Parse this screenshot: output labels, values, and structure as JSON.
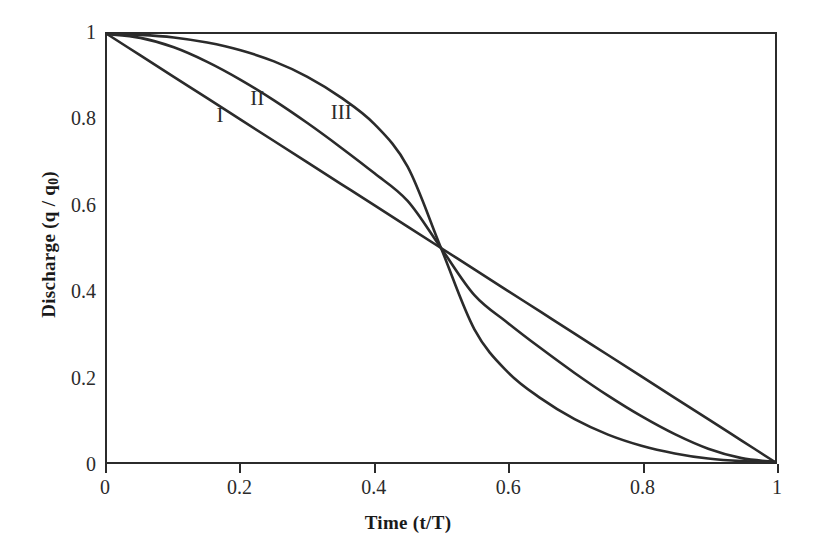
{
  "chart_data": {
    "type": "line",
    "title": "",
    "xlabel": "Time (t/T)",
    "ylabel_main": "Discharge (q / q",
    "ylabel_sub": "0",
    "ylabel_close": ")",
    "xlim": [
      0,
      1
    ],
    "ylim": [
      0,
      1
    ],
    "grid": false,
    "legend": "inline-curve-labels",
    "xticks": [
      "0",
      "0.2",
      "0.4",
      "0.6",
      "0.8",
      "1"
    ],
    "xtick_values": [
      0,
      0.2,
      0.4,
      0.6,
      0.8,
      1
    ],
    "yticks": [
      "0",
      "0.2",
      "0.4",
      "0.6",
      "0.8",
      "1"
    ],
    "ytick_values": [
      0,
      0.2,
      0.4,
      0.6,
      0.8,
      1
    ],
    "x": [
      0,
      0.05,
      0.1,
      0.15,
      0.2,
      0.25,
      0.3,
      0.35,
      0.4,
      0.45,
      0.5,
      0.55,
      0.6,
      0.65,
      0.7,
      0.75,
      0.8,
      0.85,
      0.9,
      0.95,
      1
    ],
    "series": [
      {
        "name": "I",
        "label": "I",
        "color": "#2b2b2b",
        "values": [
          1,
          0.95,
          0.9,
          0.85,
          0.8,
          0.75,
          0.7,
          0.65,
          0.6,
          0.55,
          0.5,
          0.45,
          0.4,
          0.35,
          0.3,
          0.25,
          0.2,
          0.15,
          0.1,
          0.05,
          0
        ],
        "label_x": 0.175,
        "label_y": 0.805
      },
      {
        "name": "II",
        "label": "II",
        "color": "#2b2b2b",
        "values": [
          1,
          0.991,
          0.969,
          0.935,
          0.893,
          0.845,
          0.792,
          0.735,
          0.675,
          0.61,
          0.5,
          0.39,
          0.325,
          0.265,
          0.208,
          0.155,
          0.107,
          0.065,
          0.031,
          0.009,
          0
        ],
        "label_x": 0.225,
        "label_y": 0.845
      },
      {
        "name": "III",
        "label": "III",
        "color": "#2b2b2b",
        "values": [
          1,
          0.998,
          0.992,
          0.98,
          0.962,
          0.936,
          0.9,
          0.852,
          0.79,
          0.69,
          0.5,
          0.31,
          0.21,
          0.148,
          0.1,
          0.064,
          0.038,
          0.02,
          0.008,
          0.002,
          0
        ],
        "label_x": 0.345,
        "label_y": 0.812
      }
    ]
  },
  "axes": {
    "x_title": "Time (t/T)",
    "y_title_text": "Discharge (q / q0)"
  }
}
